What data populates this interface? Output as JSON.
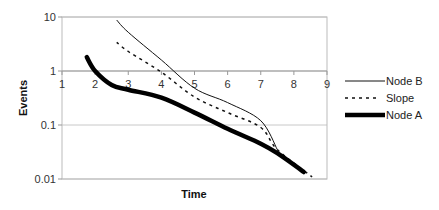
{
  "chart_data": {
    "type": "line",
    "title": "",
    "xlabel": "Time",
    "ylabel": "Events",
    "xlim": [
      1,
      9
    ],
    "ylim": [
      0.01,
      10
    ],
    "yscale": "log",
    "x_ticks": [
      "1",
      "2",
      "3",
      "4",
      "5",
      "6",
      "7",
      "8",
      "9"
    ],
    "y_ticks": [
      "10",
      "1",
      "0.1",
      "0.01"
    ],
    "grid": "horizontal major gridlines",
    "legend_position": "right",
    "series": [
      {
        "name": "Node B",
        "style": "thin solid",
        "x": [
          2.65,
          3,
          4,
          5,
          6,
          7,
          7.5
        ],
        "y": [
          8.8,
          5.2,
          1.6,
          0.48,
          0.26,
          0.12,
          0.035
        ]
      },
      {
        "name": "Slope",
        "style": "dashed",
        "x": [
          2.65,
          3,
          4,
          5,
          6,
          7,
          7.5,
          8.55
        ],
        "y": [
          3.4,
          2.3,
          0.95,
          0.33,
          0.17,
          0.09,
          0.035,
          0.011
        ]
      },
      {
        "name": "Node A",
        "style": "thick solid",
        "x": [
          1.75,
          2,
          2.5,
          3,
          4,
          5,
          6,
          7,
          7.5,
          8.3
        ],
        "y": [
          1.8,
          1.0,
          0.55,
          0.45,
          0.32,
          0.17,
          0.085,
          0.045,
          0.03,
          0.0135
        ]
      }
    ]
  },
  "legend": {
    "items": [
      {
        "label": "Node B"
      },
      {
        "label": "Slope"
      },
      {
        "label": "Node A"
      }
    ]
  }
}
